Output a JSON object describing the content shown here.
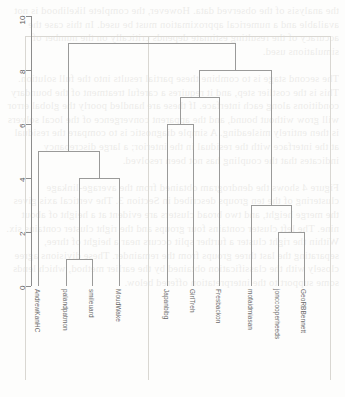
{
  "page": {
    "kind": "scanned-page-dendrogram",
    "width": 345,
    "height": 397,
    "background_color": "#fdfdfc",
    "bleed_through_text": "the analysis of the observed data. However, the complete likelihood is not available and a numerical approximation must be used. In this case the accuracy of the resulting estimate depends critically on the number of simulations used.\n\nThe second stage is to combine these partial results into the full solution. This is the costlier step, and it requires a careful treatment of the boundary conditions along each interface. If these are handled poorly the global error will grow without bound, and the apparent convergence of the local solvers is then entirely misleading. A simple diagnostic is to compare the residual at the interface with the residual in the interior; a large discrepancy indicates that the coupling has not been resolved.\n\nFigure 4 shows the dendrogram obtained from the average-linkage clustering of the ten groups described in Section 3. The vertical axis gives the merge height, and two broad clusters are evident at a height of about nine. The left cluster contains four groups and the right cluster contains six. Within the right cluster a further split occurs near a height of three, separating the last three groups from the remainder. These divisions agree closely with the classification obtained by the earlier method, which lends some support to the interpretation offered below."
  },
  "chart_data": {
    "type": "dendrogram",
    "title": "",
    "xlabel": "",
    "ylabel": "",
    "ylim": [
      0,
      10
    ],
    "y_ticks": [
      0,
      2,
      4,
      6,
      8,
      10
    ],
    "grid": false,
    "legend": "none",
    "orientation": "vertical",
    "leaf_labels": [
      "AndrewKanHC",
      "palandpatmon",
      "smileuard",
      "MoudWake",
      "Japanbibg",
      "GirlTreh",
      "Fresbackon",
      "mofaidmiasan",
      "jonccooperheeds",
      "GeoRBBennett"
    ],
    "leaf_positions_px": [
      38,
      66,
      92,
      119,
      167,
      193,
      219,
      251,
      278,
      304
    ],
    "merges": [
      {
        "id": "m1",
        "height": 1,
        "children": [
          "palandpatmon",
          "smileuard"
        ]
      },
      {
        "id": "m2",
        "height": 4,
        "children": [
          "m1",
          "MoudWake"
        ]
      },
      {
        "id": "m3",
        "height": 5,
        "children": [
          "AndrewKanHC",
          "m2"
        ]
      },
      {
        "id": "m4",
        "height": 6,
        "children": [
          "Japanbibg",
          "GirlTreh"
        ]
      },
      {
        "id": "m5",
        "height": 7,
        "children": [
          "m4",
          "Fresbackon"
        ]
      },
      {
        "id": "m6",
        "height": 2,
        "children": [
          "jonccooperheeds",
          "GeoRBBennett"
        ]
      },
      {
        "id": "m7",
        "height": 3,
        "children": [
          "mofaidmiasan",
          "m6"
        ]
      },
      {
        "id": "m8",
        "height": 8,
        "children": [
          "m5",
          "m7"
        ]
      },
      {
        "id": "m9",
        "height": 9,
        "children": [
          "m3",
          "m8"
        ]
      }
    ],
    "line_color": "#9a9a99",
    "axis_color": "#8c8c8c",
    "label_color": "#6b6b6b"
  },
  "frame": {
    "left_border_x": 25,
    "right_border_x": 330,
    "top_border_y": 36,
    "bottom_border_y": 380,
    "inner_divider_x": 148,
    "color": "#d9d7d2"
  }
}
